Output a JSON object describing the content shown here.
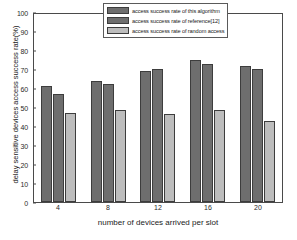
{
  "chart_data": {
    "type": "bar",
    "title": "",
    "xlabel": "number of devices arrived per slot",
    "ylabel": "delay sensitive devices access success rate(%)",
    "categories": [
      "4",
      "8",
      "12",
      "16",
      "20"
    ],
    "ylim": [
      0,
      100
    ],
    "yticks": [
      0,
      10,
      20,
      30,
      40,
      50,
      60,
      70,
      80,
      90,
      100
    ],
    "grid": false,
    "legend_position": "upper-right",
    "series": [
      {
        "name": "access success rate of this algorithm",
        "color": "#6e6e6e",
        "values": [
          61.0,
          63.5,
          69.2,
          74.5,
          71.7
        ]
      },
      {
        "name": "access success rate of reference[12]",
        "color": "#6e6e6e",
        "values": [
          56.8,
          61.9,
          69.8,
          72.7,
          70.2
        ]
      },
      {
        "name": "access success rate of random access",
        "color": "#bdbdbd",
        "values": [
          46.7,
          48.2,
          46.1,
          48.3,
          42.5
        ]
      }
    ]
  },
  "axes": {
    "frame_color": "#4a4a4a",
    "background": "#ffffff"
  }
}
